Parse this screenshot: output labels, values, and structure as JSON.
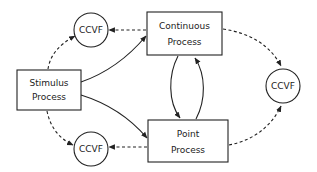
{
  "diagram": {
    "nodes": {
      "stimulus": {
        "line1": "Stimulus",
        "line2": "Process"
      },
      "continuous": {
        "line1": "Continuous",
        "line2": "Process"
      },
      "point": {
        "line1": "Point",
        "line2": "Process"
      },
      "ccvf_top_left": {
        "label": "CCVF"
      },
      "ccvf_bottom_left": {
        "label": "CCVF"
      },
      "ccvf_right": {
        "label": "CCVF"
      }
    },
    "edges": [
      {
        "from": "Stimulus Process",
        "to": "Continuous Process",
        "style": "solid"
      },
      {
        "from": "Stimulus Process",
        "to": "Point Process",
        "style": "solid"
      },
      {
        "from": "Continuous Process",
        "to": "Point Process",
        "style": "solid"
      },
      {
        "from": "Point Process",
        "to": "Continuous Process",
        "style": "solid"
      },
      {
        "from": "Stimulus Process",
        "to": "CCVF (top-left)",
        "style": "dashed"
      },
      {
        "from": "Stimulus Process",
        "to": "CCVF (bottom-left)",
        "style": "dashed"
      },
      {
        "from": "Continuous Process",
        "to": "CCVF (top-left)",
        "style": "dashed"
      },
      {
        "from": "Point Process",
        "to": "CCVF (bottom-left)",
        "style": "dashed"
      },
      {
        "from": "Continuous Process",
        "to": "CCVF (right)",
        "style": "dashed"
      },
      {
        "from": "Point Process",
        "to": "CCVF (right)",
        "style": "dashed"
      }
    ],
    "colors": {
      "stroke": "#222222",
      "background": "#ffffff"
    }
  }
}
